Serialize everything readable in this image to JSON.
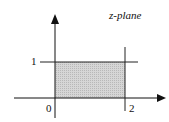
{
  "diagram": {
    "title": "z-plane",
    "labels": {
      "y_tick": "1",
      "origin": "0",
      "x_tick": "2"
    },
    "region": {
      "x_range": [
        0,
        2
      ],
      "y_range": [
        0,
        1
      ],
      "fill": "#cfcfcf"
    },
    "colors": {
      "stroke": "#111111",
      "shade": "#cfcfcf"
    }
  }
}
